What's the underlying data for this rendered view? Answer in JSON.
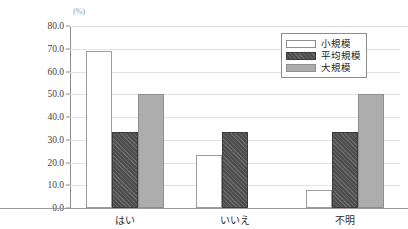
{
  "chart_data": {
    "type": "bar",
    "title": "",
    "xlabel": "",
    "ylabel": "",
    "unit_label": "(%)",
    "categories": [
      "はい",
      "いいえ",
      "不明"
    ],
    "series": [
      {
        "name": "小規模",
        "values": [
          69.2,
          23.1,
          7.7
        ],
        "color": "#ffffff",
        "pattern": "solid"
      },
      {
        "name": "平均規模",
        "values": [
          33.3,
          33.3,
          33.3
        ],
        "color": "#4d4d4d",
        "pattern": "diagonal-hatch"
      },
      {
        "name": "大規模",
        "values": [
          50.0,
          0.0,
          50.0
        ],
        "color": "#adadad",
        "pattern": "solid"
      }
    ],
    "ylim": [
      0,
      80
    ],
    "ytick_values": [
      0,
      10,
      20,
      30,
      40,
      50,
      60,
      70,
      80
    ],
    "ytick_labels": [
      "0.0",
      "10.0",
      "20.0",
      "30.0",
      "40.0",
      "50.0",
      "60.0",
      "70.0",
      "80.0"
    ],
    "grid": true,
    "legend_position": "top-right"
  },
  "colors": {
    "small": "#ffffff",
    "average": "#4d4d4d",
    "large": "#adadad",
    "axis": "#8d8d8d",
    "grid": "#e2e2e2",
    "text": "#2e2e2e"
  }
}
